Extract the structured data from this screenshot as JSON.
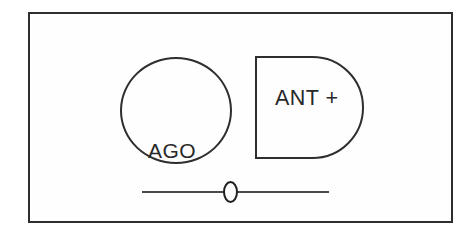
{
  "diagram": {
    "circle_node": {
      "line1": "AGO",
      "line2": ">"
    },
    "dshape_node": {
      "label": "ANT +"
    },
    "colors": {
      "stroke": "#2e2e2e",
      "text": "#282828",
      "background": "#ffffff",
      "track": "#4a4a4a"
    }
  }
}
